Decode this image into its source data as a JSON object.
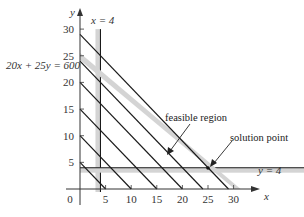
{
  "chart_data": {
    "type": "line",
    "title": "",
    "xlabel": "x",
    "ylabel": "y",
    "xlim": [
      0,
      32
    ],
    "ylim": [
      0,
      32
    ],
    "x_ticks": [
      0,
      5,
      10,
      15,
      20,
      25,
      30
    ],
    "y_ticks": [
      5,
      10,
      15,
      20,
      25,
      30
    ],
    "x_tick_labels": [
      "0",
      "5",
      "10",
      "15",
      "20",
      "25",
      "30"
    ],
    "y_tick_labels": [
      "5",
      "10",
      "15",
      "20",
      "25",
      "30"
    ],
    "constraints": [
      {
        "name": "x = 4",
        "label": "x = 4",
        "type": "vertical",
        "value": 4,
        "style": "gray band with black line"
      },
      {
        "name": "y = 4",
        "label": "y = 4",
        "type": "horizontal",
        "value": 4,
        "style": "gray band with black line"
      },
      {
        "name": "20x + 25y = 600",
        "label": "20x + 25y = 600",
        "type": "line",
        "x_intercept": 30,
        "y_intercept": 24,
        "style": "gray band"
      }
    ],
    "objective_lines": [
      {
        "equation": "x + y = 5",
        "c": 5
      },
      {
        "equation": "x + y = 10",
        "c": 10
      },
      {
        "equation": "x + y = 15",
        "c": 15
      },
      {
        "equation": "x + y = 20",
        "c": 20
      },
      {
        "equation": "x + y = 24",
        "c": 24
      },
      {
        "equation": "x + y = 29",
        "c": 29
      }
    ],
    "annotations": [
      {
        "text": "feasible region",
        "arrow_to": [
          17,
          12
        ]
      },
      {
        "text": "solution point",
        "point": [
          25,
          4
        ]
      }
    ],
    "grid": false,
    "legend": "none"
  },
  "labels": {
    "y_axis": "y",
    "x_axis": "x",
    "x_eq_4": "x = 4",
    "y_eq_4": "y = 4",
    "constraint_eq": "20x + 25y = 600",
    "feasible_region": "feasible region",
    "solution_point": "solution point"
  },
  "colors": {
    "band": "#d4d4d4",
    "line": "#1a1a1a",
    "axis": "#333333"
  }
}
